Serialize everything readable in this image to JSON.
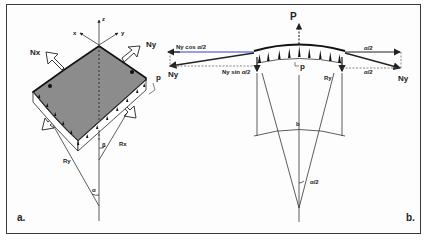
{
  "figure": {
    "panels": [
      {
        "id": "a",
        "label": "a.",
        "description": "Shell element with membrane forces",
        "labels": {
          "axis_z": "z",
          "axis_x": "x",
          "axis_y": "y",
          "force_x": "Nx",
          "force_y": "Ny",
          "pressure": "p",
          "radius_x": "Rx",
          "radius_y": "Ry",
          "angle_alpha": "α",
          "angle_beta": "β"
        }
      },
      {
        "id": "b",
        "label": "b.",
        "description": "Section through curved strip",
        "labels": {
          "resultant": "P",
          "pressure": "p",
          "force_left": "Ny",
          "force_right": "Ny",
          "horizontal_component": "Ny cos α/2",
          "vertical_component": "Ny sin α/2",
          "angle_top": "α/2",
          "angle_bottom": "α/2",
          "radius": "Ry",
          "width": "b",
          "center_angle": "α/2"
        }
      }
    ],
    "colors": {
      "line": "#222222",
      "shell_fill": "#8a8a8a",
      "highlight": "#3b3bd0",
      "frame": "#3a3a3a"
    }
  }
}
